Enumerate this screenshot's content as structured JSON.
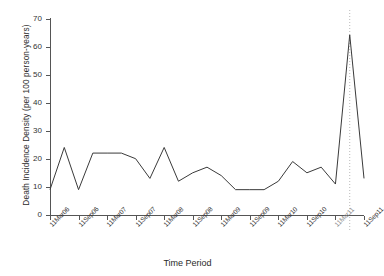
{
  "chart_data": {
    "type": "line",
    "title": "",
    "xlabel": "Time Period",
    "ylabel": "Death Incidence Density (per 100 person-years)",
    "ylim": [
      0,
      70
    ],
    "yticks": [
      0,
      10,
      20,
      30,
      40,
      50,
      60,
      70
    ],
    "grid": false,
    "legend": null,
    "x_tick_labels": [
      "11Mar06",
      "11Sep06",
      "11Mar07",
      "11Sep07",
      "11Mar08",
      "11Sep08",
      "11Mar09",
      "11Sep09",
      "11Mar10",
      "11Sep10",
      "11Mar11",
      "11Sep11"
    ],
    "x_tick_positions": [
      0,
      2,
      4,
      6,
      8,
      10,
      12,
      14,
      16,
      18,
      20,
      22
    ],
    "x": [
      0,
      1,
      2,
      3,
      4,
      5,
      6,
      7,
      8,
      9,
      10,
      11,
      12,
      13,
      14,
      15,
      16,
      17,
      18,
      19,
      20,
      21,
      22
    ],
    "values": [
      9,
      24,
      9,
      22,
      22,
      22,
      20,
      13,
      24,
      12,
      15,
      17,
      14,
      9,
      9,
      9,
      12,
      19,
      15,
      17,
      11,
      64,
      13
    ],
    "series": [
      {
        "name": "Death Incidence Density",
        "values": [
          9,
          24,
          9,
          22,
          22,
          22,
          20,
          13,
          24,
          12,
          15,
          17,
          14,
          9,
          9,
          9,
          12,
          19,
          15,
          17,
          11,
          64,
          13
        ],
        "color": "#3a3a3a"
      }
    ],
    "annotations": [
      {
        "type": "vertical-reference-line",
        "name": "peak-reference-line",
        "x": 21,
        "style": "dotted",
        "color": "#b9b9b9"
      }
    ],
    "peak": {
      "label": "11Mar11",
      "value": 64
    }
  }
}
